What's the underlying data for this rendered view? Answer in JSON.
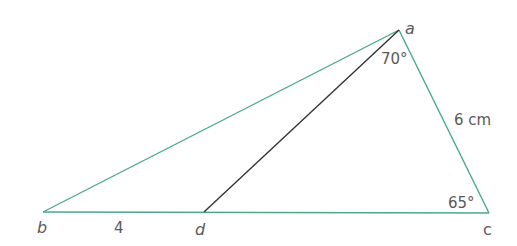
{
  "figure": {
    "type": "triangle",
    "vertices": {
      "a": {
        "label": "a",
        "x": 399,
        "y": 30
      },
      "b": {
        "label": "b",
        "x": 43,
        "y": 212
      },
      "c": {
        "label": "c",
        "x": 489,
        "y": 213
      },
      "d": {
        "label": "d",
        "x": 204,
        "y": 212
      }
    },
    "segments": [
      {
        "from": "a",
        "to": "b",
        "color": "#4aa88a"
      },
      {
        "from": "b",
        "to": "c",
        "color": "#4aa88a"
      },
      {
        "from": "c",
        "to": "a",
        "color": "#4aa88a"
      },
      {
        "from": "a",
        "to": "d",
        "color": "#333333"
      }
    ],
    "labels": {
      "angle_a": "70°",
      "angle_c": "65°",
      "side_ac": "6 cm",
      "segment_bd": "4"
    },
    "colors": {
      "triangle_stroke": "#4aa88a",
      "cevian_stroke": "#333333",
      "text": "#5a5a5a"
    }
  }
}
